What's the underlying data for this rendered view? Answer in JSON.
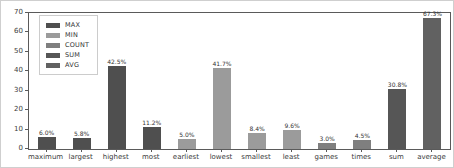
{
  "figure": {
    "background": "#ffffff",
    "border_color": "#cfcfcf",
    "axis_color": "#5a5a5a",
    "tick_label_color": "#3c3c3c",
    "bar_label_color": "#333333"
  },
  "chart_data": {
    "type": "bar",
    "title": "",
    "xlabel": "",
    "ylabel": "",
    "ylim": [
      0,
      70
    ],
    "yticks": [
      0,
      10,
      20,
      30,
      40,
      50,
      60,
      70
    ],
    "grid": false,
    "legend_position": "upper-left",
    "categories": [
      "maximum",
      "largest",
      "highest",
      "most",
      "earliest",
      "lowest",
      "smallest",
      "least",
      "games",
      "times",
      "sum",
      "average"
    ],
    "values": [
      6.0,
      5.8,
      42.5,
      11.2,
      5.0,
      41.7,
      8.4,
      9.6,
      3.0,
      4.5,
      30.8,
      67.3
    ],
    "bar_labels": [
      "6.0%",
      "5.8%",
      "42.5%",
      "11.2%",
      "5.0%",
      "41.7%",
      "8.4%",
      "9.6%",
      "3.0%",
      "4.5%",
      "30.8%",
      "67.3%"
    ],
    "bar_groups": [
      "MAX",
      "MAX",
      "MAX",
      "MAX",
      "MIN",
      "MIN",
      "MIN",
      "MIN",
      "COUNT",
      "COUNT",
      "SUM",
      "AVG"
    ],
    "legend": [
      {
        "label": "MAX",
        "color": "#4f4f4f"
      },
      {
        "label": "MIN",
        "color": "#9b9b9b"
      },
      {
        "label": "COUNT",
        "color": "#7f7f7f"
      },
      {
        "label": "SUM",
        "color": "#565656"
      },
      {
        "label": "AVG",
        "color": "#616161"
      }
    ]
  }
}
